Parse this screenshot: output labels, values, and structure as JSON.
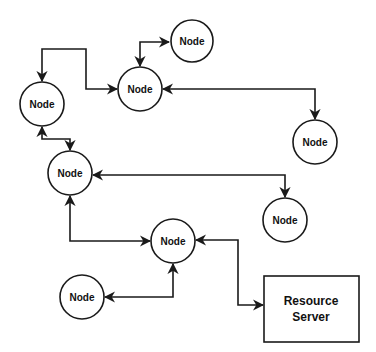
{
  "diagram": {
    "title": "",
    "colors": {
      "stroke": "#1a1a1a",
      "text": "#111111",
      "background": "#ffffff"
    },
    "nodes": [
      {
        "id": "n-top",
        "label": "Node",
        "shape": "circle",
        "cx": 192,
        "cy": 41,
        "r": 21
      },
      {
        "id": "n-left",
        "label": "Node",
        "shape": "circle",
        "cx": 42,
        "cy": 104,
        "r": 22
      },
      {
        "id": "n-upper-mid",
        "label": "Node",
        "shape": "circle",
        "cx": 140,
        "cy": 89,
        "r": 22
      },
      {
        "id": "n-right",
        "label": "Node",
        "shape": "circle",
        "cx": 315,
        "cy": 142,
        "r": 22
      },
      {
        "id": "n-mid-left",
        "label": "Node",
        "shape": "circle",
        "cx": 70,
        "cy": 173,
        "r": 22
      },
      {
        "id": "n-mid-right",
        "label": "Node",
        "shape": "circle",
        "cx": 285,
        "cy": 220,
        "r": 22
      },
      {
        "id": "n-center",
        "label": "Node",
        "shape": "circle",
        "cx": 173,
        "cy": 241,
        "r": 22
      },
      {
        "id": "n-bottom-left",
        "label": "Node",
        "shape": "circle",
        "cx": 82,
        "cy": 297,
        "r": 22
      }
    ],
    "server": {
      "id": "resource-server",
      "label_line1": "Resource",
      "label_line2": "Server",
      "x": 264,
      "y": 276,
      "w": 95,
      "h": 66
    },
    "edges": [
      {
        "from": "n-upper-mid",
        "to": "n-top",
        "bidirectional": true
      },
      {
        "from": "n-left",
        "to": "n-upper-mid",
        "bidirectional": true
      },
      {
        "from": "n-upper-mid",
        "to": "n-right",
        "bidirectional": true
      },
      {
        "from": "n-left",
        "to": "n-mid-left",
        "bidirectional": true
      },
      {
        "from": "n-mid-left",
        "to": "n-mid-right",
        "bidirectional": true
      },
      {
        "from": "n-mid-left",
        "to": "n-center",
        "bidirectional": true
      },
      {
        "from": "n-center",
        "to": "n-bottom-left",
        "bidirectional": true
      },
      {
        "from": "n-center",
        "to": "resource-server",
        "bidirectional": true
      }
    ]
  }
}
